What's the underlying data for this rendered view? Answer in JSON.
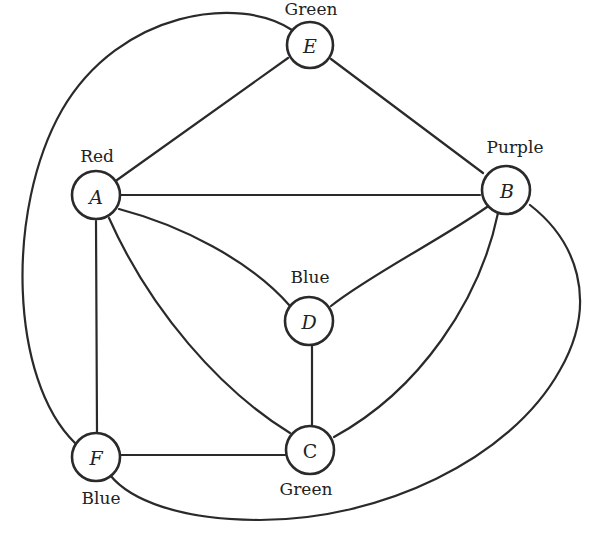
{
  "diagram": {
    "title": "",
    "type": "graph-coloring",
    "nodes": [
      {
        "id": "E",
        "letter": "E",
        "color_label": "Green",
        "cx": 310,
        "cy": 45
      },
      {
        "id": "A",
        "letter": "A",
        "color_label": "Red",
        "cx": 95,
        "cy": 195
      },
      {
        "id": "B",
        "letter": "B",
        "color_label": "Purple",
        "cx": 505,
        "cy": 188
      },
      {
        "id": "D",
        "letter": "D",
        "color_label": "Blue",
        "cx": 310,
        "cy": 322
      },
      {
        "id": "C",
        "letter": "C",
        "color_label": "Green",
        "cx": 310,
        "cy": 450
      },
      {
        "id": "F",
        "letter": "F",
        "color_label": "Blue",
        "cx": 95,
        "cy": 458
      }
    ],
    "edges": [
      {
        "from": "E",
        "to": "A",
        "shape": "straight"
      },
      {
        "from": "E",
        "to": "B",
        "shape": "straight"
      },
      {
        "from": "A",
        "to": "B",
        "shape": "straight"
      },
      {
        "from": "A",
        "to": "D",
        "shape": "curved"
      },
      {
        "from": "A",
        "to": "C",
        "shape": "curved"
      },
      {
        "from": "A",
        "to": "F",
        "shape": "straight"
      },
      {
        "from": "B",
        "to": "D",
        "shape": "curved"
      },
      {
        "from": "B",
        "to": "C",
        "shape": "curved"
      },
      {
        "from": "D",
        "to": "C",
        "shape": "straight"
      },
      {
        "from": "F",
        "to": "C",
        "shape": "straight"
      },
      {
        "from": "E",
        "to": "F",
        "shape": "outer-curve-left"
      },
      {
        "from": "B",
        "to": "F",
        "shape": "outer-curve-right-bottom"
      }
    ],
    "colors_used": [
      "Red",
      "Purple",
      "Green",
      "Blue"
    ]
  },
  "labels": {
    "E": {
      "letter": "E",
      "color": "Green"
    },
    "A": {
      "letter": "A",
      "color": "Red"
    },
    "B": {
      "letter": "B",
      "color": "Purple"
    },
    "D": {
      "letter": "D",
      "color": "Blue"
    },
    "C": {
      "letter": "C",
      "color": "Green"
    },
    "F": {
      "letter": "F",
      "color": "Blue"
    }
  }
}
